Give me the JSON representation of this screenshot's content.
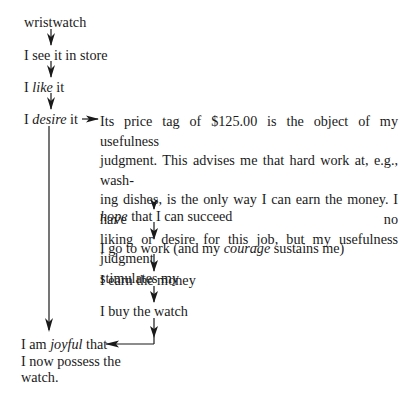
{
  "nodes": {
    "wristwatch": "wristwatch",
    "see": "I see it in store",
    "like": {
      "pre": "I ",
      "em": "like",
      "post": " it"
    },
    "desire": {
      "pre": "I ",
      "em": "desire",
      "post": " it"
    },
    "judgment_lines": [
      "Its price tag of $125.00 is the object of my usefulness",
      "judgment. This advises me that hard work at, e.g., wash-",
      "ing dishes, is the only way I can earn the money. I have no",
      "liking or desire for this job, but my usefulness judgment",
      "stimulates my"
    ],
    "hope": {
      "em": "hope",
      "post": " that I can succeed"
    },
    "work": {
      "pre": "I go to work (and my ",
      "em": "courage",
      "post": " sustains me)"
    },
    "earn": "I earn the money",
    "buy": "I buy the watch",
    "joyful": {
      "pre": "I am ",
      "em": "joyful",
      "post": " that",
      "line2": "I now possess the",
      "line3": "watch."
    }
  }
}
